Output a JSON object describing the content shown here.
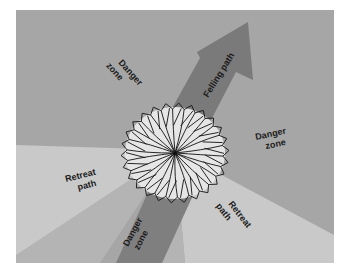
{
  "diagram": {
    "colors": {
      "background": "#a6a6a6",
      "retreat_path": "#c9c9c9",
      "retreat_mid": "#b4b4b4",
      "danger_band": "#7f7f7f",
      "felling_arrow": "#7a7a7a",
      "crown_fill": "#e6e6e6",
      "crown_lines": "#111111"
    },
    "labels": {
      "danger_zone_top_left": [
        "Danger",
        "zone"
      ],
      "felling_path": "Felling path",
      "danger_zone_right": [
        "Danger",
        "zone"
      ],
      "retreat_path_left": [
        "Retreat",
        "path"
      ],
      "danger_zone_bottom": [
        "Danger",
        "zone"
      ],
      "retreat_path_right": [
        "Retreat",
        "path"
      ]
    }
  }
}
